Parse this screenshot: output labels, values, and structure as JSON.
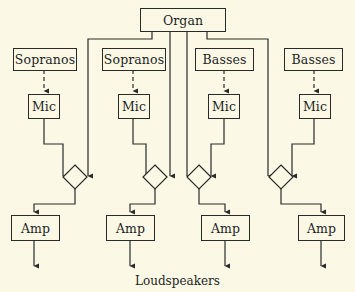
{
  "diagram": {
    "source": {
      "label": "Organ"
    },
    "channels": [
      {
        "voice": "Sopranos",
        "mic": "Mic",
        "amp": "Amp"
      },
      {
        "voice": "Sopranos",
        "mic": "Mic",
        "amp": "Amp"
      },
      {
        "voice": "Basses",
        "mic": "Mic",
        "amp": "Amp"
      },
      {
        "voice": "Basses",
        "mic": "Mic",
        "amp": "Amp"
      }
    ],
    "output_label": "Loudspeakers",
    "colors": {
      "background": "#fbf9e6",
      "stroke": "#2a2a2a"
    }
  }
}
